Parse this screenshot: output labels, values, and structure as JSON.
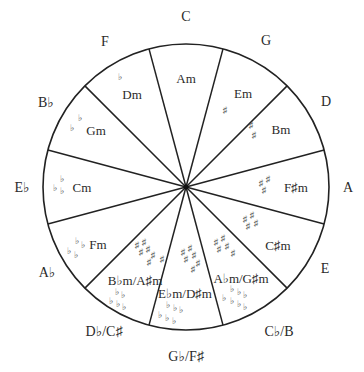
{
  "geometry": {
    "cx": 186,
    "cy": 187,
    "r": 143,
    "spoke_offset_deg": 15,
    "segments": 12
  },
  "colors": {
    "line": "#222222",
    "text": "#2a2a2a",
    "accidental": "#555555",
    "background": "#ffffff"
  },
  "major_keys": [
    {
      "label": "C",
      "x": 186,
      "y": 21
    },
    {
      "label": "G",
      "x": 266,
      "y": 45
    },
    {
      "label": "D",
      "x": 326,
      "y": 106
    },
    {
      "label": "A",
      "x": 348,
      "y": 192
    },
    {
      "label": "E",
      "x": 325,
      "y": 273
    },
    {
      "label": "C♭/B",
      "x": 279,
      "y": 336
    },
    {
      "label": "G♭/F♯",
      "x": 186,
      "y": 361
    },
    {
      "label": "D♭/C♯",
      "x": 104,
      "y": 336
    },
    {
      "label": "A♭",
      "x": 47,
      "y": 277
    },
    {
      "label": "E♭",
      "x": 22,
      "y": 192
    },
    {
      "label": "B♭",
      "x": 46,
      "y": 107
    },
    {
      "label": "F",
      "x": 105,
      "y": 46
    }
  ],
  "minor_keys": [
    {
      "label": "Am",
      "x": 186,
      "y": 83
    },
    {
      "label": "Em",
      "x": 243,
      "y": 98
    },
    {
      "label": "Bm",
      "x": 281,
      "y": 134
    },
    {
      "label": "F♯m",
      "x": 296,
      "y": 192
    },
    {
      "label": "C♯m",
      "x": 278,
      "y": 250
    },
    {
      "label": "A♭m/G♯m",
      "x": 241,
      "y": 283
    },
    {
      "label": "E♭m/D♯m",
      "x": 185,
      "y": 298
    },
    {
      "label": "B♭m/A♯m",
      "x": 135,
      "y": 285
    },
    {
      "label": "Fm",
      "x": 98,
      "y": 249
    },
    {
      "label": "Cm",
      "x": 82,
      "y": 192
    },
    {
      "label": "Gm",
      "x": 96,
      "y": 135
    },
    {
      "label": "Dm",
      "x": 132,
      "y": 99
    }
  ],
  "key_signatures": [
    {
      "key": "C",
      "sharps": 0,
      "flats": 0
    },
    {
      "key": "G",
      "sharps": 1,
      "glyph": "♯",
      "marks": [
        [
          225,
          113
        ]
      ]
    },
    {
      "key": "D",
      "sharps": 2,
      "glyph": "♯",
      "marks": [
        [
          251,
          128
        ],
        [
          254,
          138
        ]
      ]
    },
    {
      "key": "A",
      "sharps": 3,
      "glyph": "♯",
      "marks": [
        [
          261,
          186
        ],
        [
          268,
          182
        ],
        [
          264,
          193
        ]
      ]
    },
    {
      "key": "E",
      "sharps": 4,
      "glyph": "♯",
      "marks": [
        [
          245,
          222
        ],
        [
          252,
          218
        ],
        [
          248,
          229
        ],
        [
          256,
          226
        ]
      ]
    },
    {
      "key": "B",
      "sharps": 5,
      "glyph": "♯",
      "marks": [
        [
          216,
          245
        ],
        [
          223,
          241
        ],
        [
          219,
          252
        ],
        [
          227,
          249
        ],
        [
          233,
          256
        ]
      ]
    },
    {
      "key": "F#",
      "sharps": 6,
      "glyph": "♯",
      "marks": [
        [
          183,
          255
        ],
        [
          190,
          251
        ],
        [
          186,
          262
        ],
        [
          194,
          258
        ],
        [
          198,
          266
        ],
        [
          193,
          272
        ]
      ]
    },
    {
      "key": "C#",
      "sharps": 7,
      "glyph": "♯",
      "marks": [
        [
          137,
          248
        ],
        [
          144,
          245
        ],
        [
          141,
          255
        ],
        [
          148,
          252
        ],
        [
          153,
          258
        ],
        [
          149,
          265
        ],
        [
          162,
          262
        ]
      ]
    },
    {
      "key": "Cb",
      "flats": 7,
      "glyph": "♭",
      "marks": [
        [
          232,
          292
        ],
        [
          239,
          295
        ],
        [
          245,
          298
        ],
        [
          224,
          301
        ],
        [
          232,
          304
        ],
        [
          239,
          307
        ],
        [
          245,
          310
        ]
      ]
    },
    {
      "key": "Gb",
      "flats": 6,
      "glyph": "♭",
      "marks": [
        [
          168,
          308
        ],
        [
          175,
          311
        ],
        [
          181,
          313
        ],
        [
          160,
          318
        ],
        [
          167,
          321
        ],
        [
          174,
          324
        ]
      ]
    },
    {
      "key": "Db",
      "flats": 5,
      "glyph": "♭",
      "marks": [
        [
          117,
          295
        ],
        [
          123,
          298
        ],
        [
          111,
          304
        ],
        [
          118,
          307
        ],
        [
          124,
          310
        ]
      ]
    },
    {
      "key": "Ab",
      "flats": 4,
      "glyph": "♭",
      "marks": [
        [
          77,
          244
        ],
        [
          83,
          248
        ],
        [
          69,
          254
        ],
        [
          76,
          258
        ]
      ]
    },
    {
      "key": "Eb",
      "flats": 3,
      "glyph": "♭",
      "marks": [
        [
          62,
          182
        ],
        [
          55,
          191
        ],
        [
          62,
          194
        ]
      ]
    },
    {
      "key": "Bb",
      "flats": 2,
      "glyph": "♭",
      "marks": [
        [
          80,
          121
        ],
        [
          72,
          131
        ]
      ]
    },
    {
      "key": "F",
      "flats": 1,
      "glyph": "♭",
      "marks": [
        [
          120,
          80
        ]
      ]
    }
  ]
}
